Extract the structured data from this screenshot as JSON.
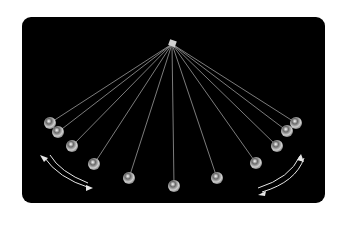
{
  "diagram": {
    "background_color": "#000000",
    "string_color": "#9a9a9a",
    "ball_color": "#d8d8d8",
    "arrow_color": "#e6e6e6",
    "pivot": {
      "x": 172,
      "y": 44
    },
    "balls": [
      {
        "x": 50,
        "y": 123
      },
      {
        "x": 58,
        "y": 132
      },
      {
        "x": 72,
        "y": 146
      },
      {
        "x": 94,
        "y": 164
      },
      {
        "x": 129,
        "y": 178
      },
      {
        "x": 174,
        "y": 186
      },
      {
        "x": 217,
        "y": 178
      },
      {
        "x": 256,
        "y": 163
      },
      {
        "x": 277,
        "y": 146
      },
      {
        "x": 287,
        "y": 131
      },
      {
        "x": 296,
        "y": 123
      }
    ],
    "arrows": [
      {
        "name": "left-swing-arrows",
        "side": "left"
      },
      {
        "name": "right-swing-arrows",
        "side": "right"
      }
    ]
  }
}
